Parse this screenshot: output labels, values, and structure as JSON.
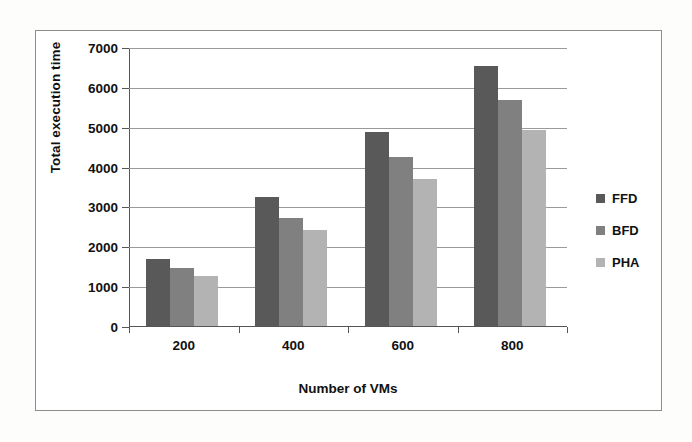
{
  "chart_data": {
    "type": "bar",
    "title": "",
    "xlabel": "Number of VMs",
    "ylabel": "Total execution time",
    "categories": [
      "200",
      "400",
      "600",
      "800"
    ],
    "series": [
      {
        "name": "FFD",
        "color": "#595959",
        "values": [
          1670,
          3230,
          4870,
          6520
        ]
      },
      {
        "name": "BFD",
        "color": "#808080",
        "values": [
          1450,
          2720,
          4250,
          5680
        ]
      },
      {
        "name": "PHA",
        "color": "#b3b3b3",
        "values": [
          1250,
          2400,
          3680,
          4930
        ]
      }
    ],
    "ylim": [
      0,
      7000
    ],
    "yticks": [
      0,
      1000,
      2000,
      3000,
      4000,
      5000,
      6000,
      7000
    ],
    "ytick_labels": [
      "0",
      "1000",
      "2000",
      "3000",
      "4000",
      "5000",
      "6000",
      "7000"
    ],
    "grid": true,
    "legend_position": "right"
  },
  "legend": {
    "entries": [
      {
        "label": "FFD",
        "color": "#595959"
      },
      {
        "label": "BFD",
        "color": "#808080"
      },
      {
        "label": "PHA",
        "color": "#b3b3b3"
      }
    ]
  },
  "axes": {
    "x_title": "Number of VMs",
    "y_title": "Total execution time"
  }
}
